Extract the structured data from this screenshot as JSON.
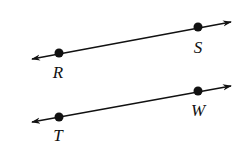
{
  "diagram": {
    "title": "",
    "stroke_color": "#111111",
    "background": "#ffffff",
    "lines": [
      {
        "id": "line-RS",
        "name": "Line RS",
        "x1": 32,
        "y1": 59,
        "x2": 231,
        "y2": 22,
        "points": [
          {
            "label": "R",
            "x": 59,
            "y": 53,
            "label_x": 58,
            "label_y": 78
          },
          {
            "label": "S",
            "x": 198,
            "y": 27,
            "label_x": 198,
            "label_y": 53
          }
        ]
      },
      {
        "id": "line-TW",
        "name": "Line TW",
        "x1": 32,
        "y1": 122,
        "x2": 231,
        "y2": 86,
        "points": [
          {
            "label": "T",
            "x": 59,
            "y": 117,
            "label_x": 58,
            "label_y": 141
          },
          {
            "label": "W",
            "x": 198,
            "y": 91,
            "label_x": 198,
            "label_y": 116
          }
        ]
      }
    ]
  }
}
